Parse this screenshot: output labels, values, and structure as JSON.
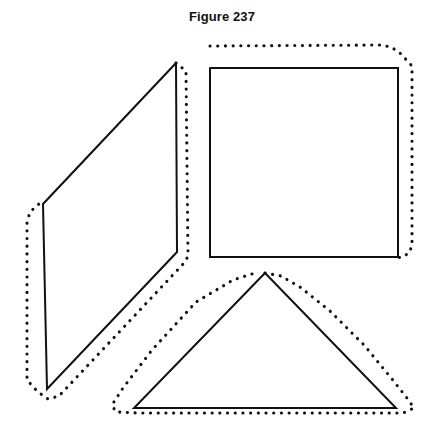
{
  "figure": {
    "title": "Figure 237",
    "background_color": "#ffffff",
    "ink_color": "#111111",
    "width": 444,
    "height": 432
  },
  "shapes": {
    "parallelogram": {
      "name": "parallelogram",
      "solid_outline_points": "176,63 177,252 47,389 43,204 176,63",
      "dotted_outline_points": "176,63 186,71 188,256 185,262 59,396 48,399 38,392 27,380 27,222 30,212 40,203",
      "solid_style": "solid",
      "dotted_style": "dotted"
    },
    "square": {
      "name": "square",
      "solid_outline_points": "210,68 398,68 398,257 210,257 210,68",
      "dotted_outline_points": "210,46 381,45 391,47 400,53 412,66 412,243 410,252 403,257 396,258",
      "solid_style": "solid",
      "dotted_style": "dotted"
    },
    "triangle": {
      "name": "triangle",
      "solid_outline_points": "265,273 396,408 134,408 265,273",
      "dotted_outline_points": "265,273 281,276 300,287 330,311 364,345 392,379 407,398 414,408 403,413 138,413 116,412 112,405 123,388 152,350 196,302 233,280 252,274",
      "solid_style": "solid",
      "dotted_style": "dotted"
    }
  }
}
